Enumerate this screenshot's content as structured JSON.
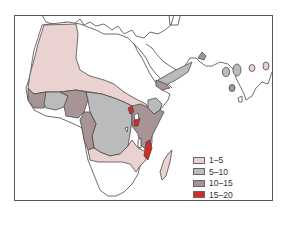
{
  "map": {
    "region": "Africa, Middle East and South Asia",
    "colors": {
      "land": "#ffffff",
      "outline": "#4a4a4a",
      "c1_5": "#ead2d0",
      "c5_10": "#b9bbbd",
      "c10_15": "#a89395",
      "c15_20": "#d42a2a"
    }
  },
  "legend": {
    "items": [
      {
        "label": "1–5",
        "color": "#ead2d0"
      },
      {
        "label": "5–10",
        "color": "#b9bbbd"
      },
      {
        "label": "10–15",
        "color": "#a89395"
      },
      {
        "label": "15–20",
        "color": "#d42a2a"
      }
    ]
  }
}
